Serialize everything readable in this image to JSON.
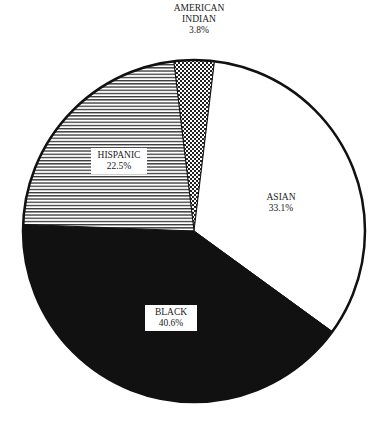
{
  "chart_data": {
    "type": "pie",
    "title": "",
    "start_angle_deg": -96.8,
    "direction": "clockwise",
    "slices": [
      {
        "label": "AMERICAN INDIAN",
        "value": 3.8,
        "value_label": "3.8%",
        "pattern": "crosshatch"
      },
      {
        "label": "ASIAN",
        "value": 33.1,
        "value_label": "33.1%",
        "pattern": "white"
      },
      {
        "label": "BLACK",
        "value": 40.6,
        "value_label": "40.6%",
        "pattern": "solid-black"
      },
      {
        "label": "HISPANIC",
        "value": 22.5,
        "value_label": "22.5%",
        "pattern": "horizontal-lines"
      }
    ]
  },
  "labels": {
    "american_indian": {
      "line1": "AMERICAN",
      "line2": "INDIAN",
      "pct": "3.8%"
    },
    "asian": {
      "line1": "ASIAN",
      "pct": "33.1%"
    },
    "black": {
      "line1": "BLACK",
      "pct": "40.6%"
    },
    "hispanic": {
      "line1": "HISPANIC",
      "pct": "22.5%"
    }
  }
}
